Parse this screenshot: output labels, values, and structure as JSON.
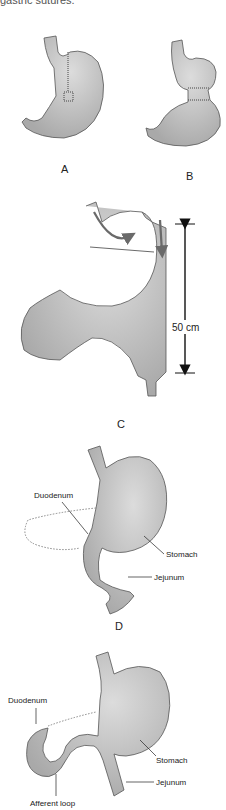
{
  "header": {
    "cut_text": "gastric sutures."
  },
  "panels": {
    "A": {
      "letter": "A"
    },
    "B": {
      "letter": "B"
    },
    "C": {
      "letter": "C",
      "measure": "50 cm"
    },
    "D": {
      "letter": "D",
      "labels": {
        "duodenum": "Duodenum",
        "stomach": "Stomach",
        "jejunum": "Jejunum"
      }
    },
    "E": {
      "labels": {
        "duodenum": "Duodenum",
        "stomach": "Stomach",
        "jejunum": "Jejunum",
        "afferent": "Afferent loop"
      }
    }
  },
  "colors": {
    "organ_fill": "#b8b8b8",
    "organ_light": "#d6d6d6",
    "outline": "#555555",
    "arrow": "#6a6a6a"
  }
}
